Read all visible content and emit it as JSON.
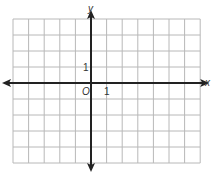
{
  "grid": {
    "left": 13,
    "top": 19,
    "cols": 12,
    "rows": 9,
    "cell_w": 15.6,
    "cell_h": 16,
    "origin_col": 5,
    "origin_row": 4,
    "grid_color": "#b8b8b8",
    "axis_color": "#222222"
  },
  "labels": {
    "x_axis": "x",
    "y_axis": "y",
    "origin": "O",
    "x_unit": "1",
    "y_unit": "1"
  }
}
